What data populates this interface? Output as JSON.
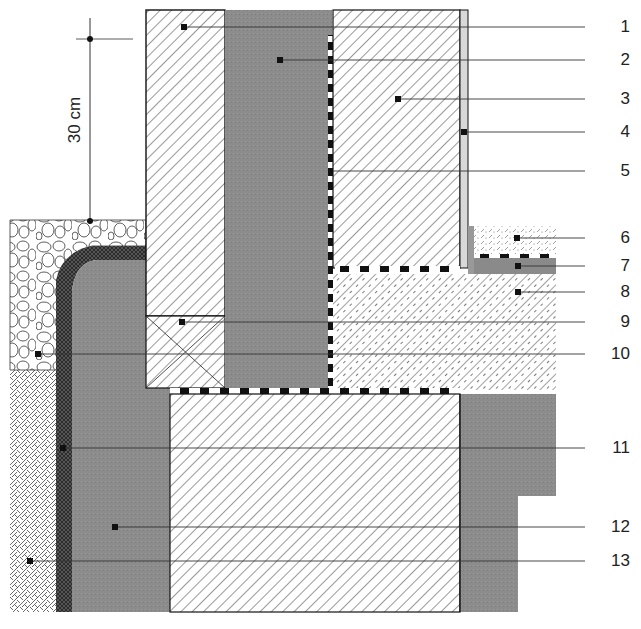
{
  "figure": {
    "type": "construction-section-detail",
    "dimension": {
      "label": "30 cm",
      "orientation": "vertical"
    },
    "callouts": [
      {
        "id": "1",
        "label": "1",
        "y": 27
      },
      {
        "id": "2",
        "label": "2",
        "y": 60
      },
      {
        "id": "3",
        "label": "3",
        "y": 99
      },
      {
        "id": "4",
        "label": "4",
        "y": 132
      },
      {
        "id": "5",
        "label": "5",
        "y": 171
      },
      {
        "id": "6",
        "label": "6",
        "y": 238
      },
      {
        "id": "7",
        "label": "7",
        "y": 266
      },
      {
        "id": "8",
        "label": "8",
        "y": 292
      },
      {
        "id": "9",
        "label": "9",
        "y": 322
      },
      {
        "id": "10",
        "label": "10",
        "y": 354
      },
      {
        "id": "11",
        "label": "11",
        "y": 448
      },
      {
        "id": "12",
        "label": "12",
        "y": 527
      },
      {
        "id": "13",
        "label": "13",
        "y": 561
      }
    ],
    "colors": {
      "concrete_gray": "#8e8e8e",
      "line": "#1a1a1a",
      "hatch": "#333333",
      "background": "#ffffff"
    }
  }
}
